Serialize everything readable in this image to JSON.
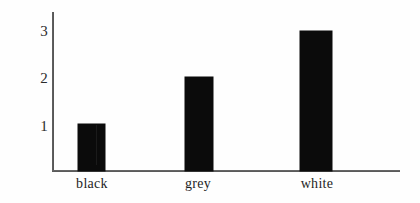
{
  "chart_data": {
    "type": "bar",
    "title": "",
    "subtitle": "",
    "xlabel": "",
    "ylabel": "",
    "categories": [
      "black",
      "grey",
      "white"
    ],
    "values": [
      1,
      2,
      3
    ],
    "series": [
      {
        "name": "",
        "values": [
          1,
          2,
          3
        ]
      }
    ],
    "ytick_labels": [
      "1",
      "2",
      "3"
    ],
    "ytick_values": [
      1,
      2,
      3
    ],
    "ylim": [
      0,
      3.4
    ],
    "xtick_labels": [
      "black",
      "grey",
      "white"
    ],
    "grid": false,
    "legend": null,
    "legend_position": "none",
    "bar_color": "#0b0b0b",
    "axis_color": "#3d3d3d",
    "background": "#fefefe",
    "annotations": []
  },
  "axes": {
    "y_ticks": [
      {
        "label": "3",
        "value": 3
      },
      {
        "label": "2",
        "value": 2
      },
      {
        "label": "1",
        "value": 1
      }
    ],
    "x_ticks": [
      {
        "label": "black"
      },
      {
        "label": "grey"
      },
      {
        "label": "white"
      }
    ]
  },
  "bars": [
    {
      "category": "black",
      "value": 1,
      "color": "#0b0b0b"
    },
    {
      "category": "grey",
      "value": 2,
      "color": "#0b0b0b"
    },
    {
      "category": "white",
      "value": 3,
      "color": "#0b0b0b"
    }
  ]
}
